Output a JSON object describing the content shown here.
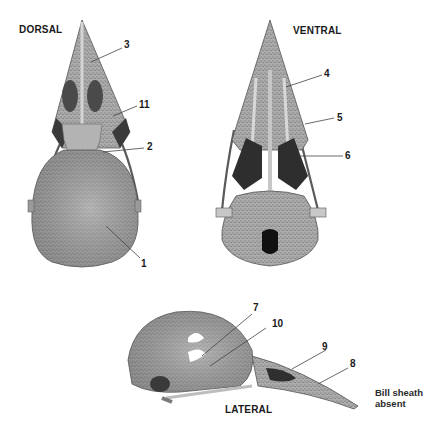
{
  "views": {
    "dorsal": {
      "title": "DORSAL"
    },
    "ventral": {
      "title": "VENTRAL"
    },
    "lateral": {
      "title": "LATERAL"
    }
  },
  "labels": {
    "l1": "1",
    "l2": "2",
    "l3": "3",
    "l4": "4",
    "l5": "5",
    "l6": "6",
    "l7": "7",
    "l8": "8",
    "l9": "9",
    "l10": "10",
    "l11": "11"
  },
  "note": {
    "line1": "Bill sheath",
    "line2": "absent"
  },
  "colors": {
    "bone_light": "#b8b8b8",
    "bone_mid": "#8c8c8c",
    "bone_dark": "#3c3c3c",
    "leader_line": "#444444",
    "text": "#1a1a1a"
  }
}
